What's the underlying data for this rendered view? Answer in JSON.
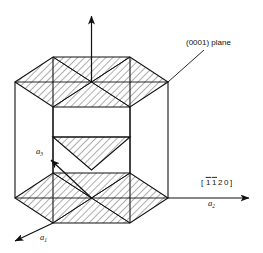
{
  "figure": {
    "title_visible": false,
    "type": "crystallography-diagram",
    "colors": {
      "line": "#111111",
      "hatch": "#333333",
      "background": "#ffffff"
    },
    "annotations": {
      "plane_label": "(0001) plane",
      "direction_label_bracket_open": "[",
      "direction_label_digits": "1120",
      "direction_label_bracket_close": "]",
      "direction_label_full": "[1120]"
    },
    "axes": [
      {
        "name": "c-axis",
        "label": "",
        "direction": "up"
      },
      {
        "name": "a1",
        "label": "a",
        "subscript": "1",
        "direction": "down-left"
      },
      {
        "name": "a2",
        "label": "a",
        "subscript": "2",
        "direction": "right"
      },
      {
        "name": "a3",
        "label": "a",
        "subscript": "3",
        "direction": "up-left"
      }
    ],
    "geometry": {
      "top_hexagon_center_y": 82,
      "bottom_hexagon_center_y": 198,
      "hexagon_left_x": 15,
      "hexagon_right_x": 168,
      "hexagon_center_x": 95
    }
  }
}
